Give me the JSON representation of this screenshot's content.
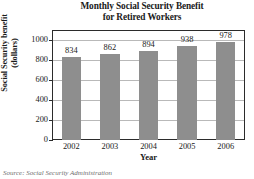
{
  "chart_data": {
    "type": "bar",
    "title": "Monthly Social Security Benefit for Retired Workers",
    "title_line1": "Monthly Social Security Benefit",
    "title_line2": "for Retired Workers",
    "xlabel": "Year",
    "ylabel": "Social Security benefit (dollars)",
    "ylabel_line1": "Social Security benefit",
    "ylabel_line2": "(dollars)",
    "categories": [
      "2002",
      "2003",
      "2004",
      "2005",
      "2006"
    ],
    "values": [
      834,
      862,
      894,
      938,
      978
    ],
    "data_labels": [
      "834",
      "862",
      "894",
      "938",
      "978"
    ],
    "ylim": [
      0,
      1100
    ],
    "yticks": [
      0,
      200,
      400,
      600,
      800,
      1000
    ],
    "ytick_labels": [
      "0",
      "200",
      "400",
      "600",
      "800",
      "1000"
    ],
    "grid": true,
    "grid_axis": "y",
    "legend": false,
    "bar_color": "#8e8e8e",
    "frame_color": "#2b2b2b",
    "gridline_color": "#b9b9b9",
    "background": "#ffffff"
  },
  "source": {
    "text": "Source: Social Security Administration"
  }
}
